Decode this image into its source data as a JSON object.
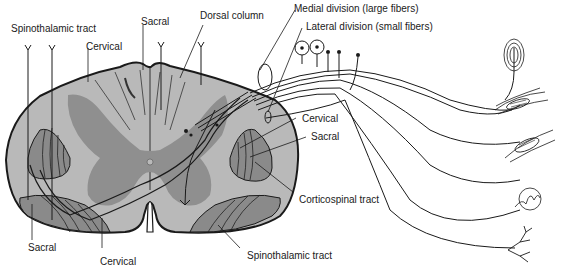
{
  "diagram": {
    "type": "anatomical cross-section",
    "colors": {
      "white_matter": "#b9b9b9",
      "gray_matter": "#8f8f8f",
      "tract": "#8a8a8a",
      "outline": "#1a1a1a",
      "background": "#ffffff"
    },
    "labels": {
      "spinothalamic_top": "Spinothalamic tract",
      "cervical_top": "Cervical",
      "sacral_top": "Sacral",
      "dorsal_column": "Dorsal column",
      "medial_division": "Medial division (large fibers)",
      "lateral_division": "Lateral division (small fibers)",
      "cervical_right": "Cervical",
      "sacral_right": "Sacral",
      "corticospinal": "Corticospinal tract",
      "spinothalamic_bottom": "Spinothalamic tract",
      "sacral_bottom": "Sacral",
      "cervical_bottom": "Cervical"
    },
    "receptors": [
      "pacinian-corpuscle",
      "muscle-spindle",
      "golgi-tendon-organ",
      "meissner-corpuscle",
      "free-nerve-ending"
    ]
  }
}
